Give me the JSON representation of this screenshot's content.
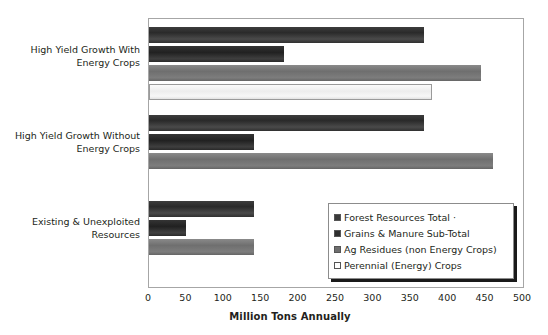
{
  "chart_data": {
    "type": "bar",
    "orientation": "horizontal",
    "title": "",
    "xlabel": "Million Tons Annually",
    "ylabel": "",
    "xlim": [
      0,
      500
    ],
    "xticks": [
      "0",
      "50",
      "100",
      "150",
      "200",
      "250",
      "300",
      "350",
      "400",
      "450",
      "500"
    ],
    "grid": false,
    "legend_position": "inside lower-right",
    "categories": [
      "High Yield Growth With Energy Crops",
      "High Yield Growth Without Energy Crops",
      "Existing & Unexploited Resources"
    ],
    "series": [
      {
        "name": "Forest Resources Total  ·",
        "color": "#3a3a3a",
        "values": [
          368,
          368,
          140
        ]
      },
      {
        "name": "Grains & Manure Sub-Total",
        "color": "#2e2e2e",
        "values": [
          180,
          140,
          50
        ]
      },
      {
        "name": "Ag Residues (non Energy Crops)",
        "color": "#6e6e6e",
        "values": [
          444,
          460,
          140
        ]
      },
      {
        "name": "Perennial (Energy) Crops",
        "color": "#ffffff",
        "values": [
          378,
          null,
          null
        ]
      }
    ]
  },
  "axis": {
    "x_title": "Million Tons Annually",
    "ticks": [
      "0",
      "50",
      "100",
      "150",
      "200",
      "250",
      "300",
      "350",
      "400",
      "450",
      "500"
    ]
  },
  "categories": {
    "items": [
      {
        "line1": "High Yield Growth With",
        "line2": "Energy Crops"
      },
      {
        "line1": "High Yield Growth Without",
        "line2": "Energy Crops"
      },
      {
        "line1": "Existing & Unexploited",
        "line2": "Resources"
      }
    ]
  },
  "legend": {
    "items": [
      {
        "label": "Forest Resources Total  ·"
      },
      {
        "label": "Grains & Manure Sub-Total"
      },
      {
        "label": "Ag Residues (non Energy Crops)"
      },
      {
        "label": "Perennial (Energy) Crops"
      }
    ]
  }
}
